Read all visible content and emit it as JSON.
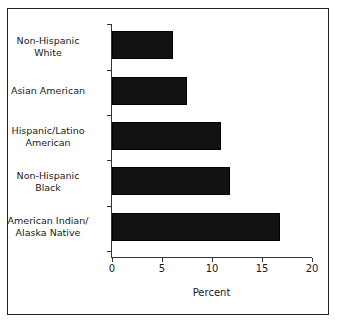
{
  "chart_data": {
    "type": "bar",
    "orientation": "horizontal",
    "title": "",
    "xlabel": "Percent",
    "ylabel": "",
    "xlim": [
      0,
      20
    ],
    "xticks": [
      0,
      5,
      10,
      15,
      20
    ],
    "xtick_labels": [
      "0",
      "5",
      "10",
      "15",
      "20"
    ],
    "grid": false,
    "legend": null,
    "categories": [
      "Non-Hispanic\nWhite",
      "Asian American",
      "Hispanic/Latino\nAmerican",
      "Non-Hispanic\nBlack",
      "American Indian/\nAlaska Native"
    ],
    "values": [
      6.1,
      7.5,
      10.9,
      11.8,
      16.8
    ],
    "bar_color": "#121212",
    "axis_color": "#333333",
    "frame_color": "#222222",
    "background": "#ffffff"
  }
}
